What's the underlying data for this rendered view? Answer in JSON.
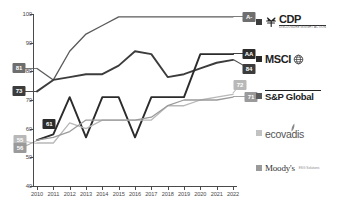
{
  "chart_data": {
    "type": "line",
    "title": "",
    "xlabel": "",
    "ylabel": "",
    "x": [
      2010,
      2011,
      2012,
      2013,
      2014,
      2015,
      2016,
      2017,
      2018,
      2019,
      2020,
      2021,
      2022
    ],
    "xticklabels": [
      "2010",
      "2011",
      "2012",
      "2013",
      "2014",
      "2015",
      "2016",
      "2017",
      "2018",
      "2019",
      "2020",
      "2021",
      "2022"
    ],
    "ylim": [
      40,
      100
    ],
    "yticklabels": [
      "100",
      "90",
      "80",
      "70",
      "60",
      "50",
      "40"
    ],
    "yticks": [
      100,
      90,
      80,
      70,
      60,
      50,
      40
    ],
    "grid": false,
    "legend_position": "right",
    "series": [
      {
        "name": "CDP",
        "color": "#5a5a5a",
        "values": [
          81,
          77,
          87,
          93,
          96,
          99,
          99,
          99,
          99,
          99,
          99,
          99,
          99
        ],
        "start_label": "81",
        "end_label": "A-"
      },
      {
        "name": "MSCI",
        "color": "#3c3c3c",
        "values": [
          73,
          77,
          78,
          79,
          79,
          82,
          87,
          86,
          78,
          79,
          81,
          83,
          84
        ],
        "start_label": "73",
        "end_label": "84"
      },
      {
        "name": "S&P Global",
        "color": "#2b2b2b",
        "values": [
          56,
          58,
          71,
          57,
          71,
          71,
          57,
          71,
          71,
          71,
          86,
          86,
          86
        ],
        "start_label": "61",
        "end_label": "AA"
      },
      {
        "name": "ecovadis",
        "color": "#b8b8b8",
        "values": [
          55,
          55,
          62,
          60,
          63,
          63,
          63,
          63,
          68,
          68,
          70,
          71,
          72
        ],
        "start_label": "55",
        "end_label": "72"
      },
      {
        "name": "Moody's",
        "color": "#9a9a9a",
        "values": [
          56,
          57,
          59,
          63,
          63,
          63,
          63,
          64,
          68,
          70,
          70,
          70,
          71
        ],
        "start_label": "56",
        "end_label": "71"
      }
    ],
    "callouts": [
      {
        "label": "81",
        "x": 2010,
        "y": 81,
        "color": "#6e6e6e",
        "dx": -18,
        "dy": 0
      },
      {
        "label": "73",
        "x": 2010,
        "y": 73,
        "color": "#3c3c3c",
        "dx": -18,
        "dy": 0
      },
      {
        "label": "61",
        "x": 2011,
        "y": 61,
        "color": "#2b2b2b",
        "dx": -4,
        "dy": -2
      },
      {
        "label": "55",
        "x": 2010,
        "y": 55,
        "color": "#b8b8b8",
        "dx": -17,
        "dy": -3
      },
      {
        "label": "56",
        "x": 2010,
        "y": 56,
        "color": "#9a9a9a",
        "dx": -17,
        "dy": 8
      },
      {
        "label": "A-",
        "x": 2022,
        "y": 99,
        "color": "#6e6e6e",
        "dx": 16,
        "dy": 0
      },
      {
        "label": "AA",
        "x": 2022,
        "y": 86,
        "color": "#2b2b2b",
        "dx": 16,
        "dy": 0
      },
      {
        "label": "84",
        "x": 2022,
        "y": 84,
        "color": "#3c3c3c",
        "dx": 16,
        "dy": 9
      },
      {
        "label": "72",
        "x": 2022,
        "y": 72,
        "color": "#b8b8b8",
        "dx": 7,
        "dy": -9
      },
      {
        "label": "71",
        "x": 2022,
        "y": 71,
        "color": "#9a9a9a",
        "dx": 18,
        "dy": 0
      }
    ]
  },
  "legend": {
    "items": [
      {
        "key": "cdp",
        "label": "CDP",
        "sub": "DISCLOSURE INSIGHT ACTION",
        "swatch_color": "#3c3c3c"
      },
      {
        "key": "msci",
        "label": "MSCI",
        "sub": "",
        "swatch_color": "#2b2b2b"
      },
      {
        "key": "sp-global",
        "label": "S&P Global",
        "sub": "",
        "swatch_color": "#5a5a5a"
      },
      {
        "key": "ecovadis",
        "label": "ecovadis",
        "sub": "",
        "swatch_color": "#c2c2c2"
      },
      {
        "key": "moodys",
        "label": "Moody's",
        "sub": "ESG Solutions",
        "swatch_color": "#9a9a9a"
      }
    ]
  },
  "axis": {
    "line_color": "#4a4a4a"
  }
}
